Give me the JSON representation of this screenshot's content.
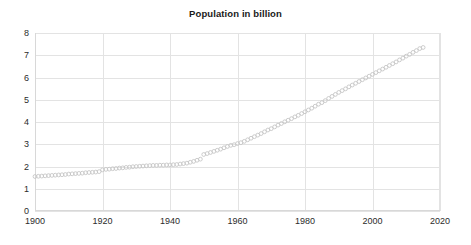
{
  "chart": {
    "title": "Population in billion"
  },
  "axes": {
    "y_ticks": [
      "0",
      "1",
      "2",
      "3",
      "4",
      "5",
      "6",
      "7",
      "8"
    ],
    "x_ticks": [
      "1900",
      "1920",
      "1940",
      "1960",
      "1980",
      "2000",
      "2020"
    ]
  },
  "style": {
    "marker_color": "#c6c6c6",
    "grid_color": "#e3e3e3",
    "axis_color": "#d8d8d8",
    "title_color": "#1a1a1a",
    "tick_label_color": "#2b2b2b",
    "background": "#ffffff"
  },
  "chart_data": {
    "type": "scatter",
    "title": "Population in billion",
    "xlabel": "",
    "ylabel": "",
    "xlim": [
      1900,
      2020
    ],
    "ylim": [
      0,
      8
    ],
    "grid": true,
    "legend": "none",
    "marker": "open-circle",
    "series": [
      {
        "name": "Population in billion",
        "x": [
          1900,
          1901,
          1902,
          1903,
          1904,
          1905,
          1906,
          1907,
          1908,
          1909,
          1910,
          1911,
          1912,
          1913,
          1914,
          1915,
          1916,
          1917,
          1918,
          1919,
          1920,
          1921,
          1922,
          1923,
          1924,
          1925,
          1926,
          1927,
          1928,
          1929,
          1930,
          1931,
          1932,
          1933,
          1934,
          1935,
          1936,
          1937,
          1938,
          1939,
          1940,
          1941,
          1942,
          1943,
          1944,
          1945,
          1946,
          1947,
          1948,
          1949,
          1950,
          1951,
          1952,
          1953,
          1954,
          1955,
          1956,
          1957,
          1958,
          1959,
          1960,
          1961,
          1962,
          1963,
          1964,
          1965,
          1966,
          1967,
          1968,
          1969,
          1970,
          1971,
          1972,
          1973,
          1974,
          1975,
          1976,
          1977,
          1978,
          1979,
          1980,
          1981,
          1982,
          1983,
          1984,
          1985,
          1986,
          1987,
          1988,
          1989,
          1990,
          1991,
          1992,
          1993,
          1994,
          1995,
          1996,
          1997,
          1998,
          1999,
          2000,
          2001,
          2002,
          2003,
          2004,
          2005,
          2006,
          2007,
          2008,
          2009,
          2010,
          2011,
          2012,
          2013,
          2014,
          2015
        ],
        "y": [
          1.55,
          1.56,
          1.57,
          1.58,
          1.59,
          1.6,
          1.61,
          1.62,
          1.63,
          1.64,
          1.66,
          1.67,
          1.68,
          1.69,
          1.7,
          1.72,
          1.73,
          1.74,
          1.75,
          1.77,
          1.85,
          1.87,
          1.88,
          1.9,
          1.91,
          1.93,
          1.94,
          1.96,
          1.97,
          1.99,
          2.0,
          2.01,
          2.02,
          2.03,
          2.04,
          2.05,
          2.05,
          2.06,
          2.06,
          2.07,
          2.07,
          2.08,
          2.09,
          2.11,
          2.13,
          2.15,
          2.19,
          2.23,
          2.28,
          2.33,
          2.54,
          2.58,
          2.63,
          2.68,
          2.73,
          2.78,
          2.84,
          2.9,
          2.95,
          2.98,
          3.03,
          3.07,
          3.13,
          3.2,
          3.27,
          3.34,
          3.41,
          3.48,
          3.56,
          3.64,
          3.7,
          3.78,
          3.86,
          3.93,
          4.01,
          4.08,
          4.15,
          4.23,
          4.3,
          4.38,
          4.46,
          4.54,
          4.62,
          4.71,
          4.8,
          4.87,
          4.96,
          5.06,
          5.15,
          5.24,
          5.33,
          5.41,
          5.49,
          5.58,
          5.66,
          5.74,
          5.82,
          5.9,
          5.98,
          6.06,
          6.14,
          6.22,
          6.3,
          6.38,
          6.46,
          6.54,
          6.62,
          6.7,
          6.79,
          6.87,
          6.96,
          7.04,
          7.13,
          7.21,
          7.3,
          7.35
        ]
      }
    ]
  }
}
